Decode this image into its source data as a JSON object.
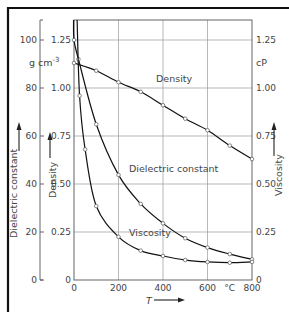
{
  "chart_data": {
    "type": "line",
    "title": "",
    "xlabel": "T",
    "x_unit": "°C",
    "xlim": [
      0,
      800
    ],
    "x_ticks": [
      0,
      200,
      400,
      600,
      800
    ],
    "x_tick_labels": [
      "0",
      "200",
      "400",
      "600",
      "°C",
      "800"
    ],
    "grid": true,
    "axes": {
      "left_outer": {
        "label": "Dielectric constant",
        "ticks": [
          0,
          20,
          40,
          60,
          80,
          100
        ],
        "tick_labels": [
          "0",
          "20",
          "40",
          "60",
          "80",
          "100"
        ],
        "ylim": [
          0,
          100
        ]
      },
      "left_inner": {
        "label": "Density",
        "unit": "g cm⁻³",
        "ticks": [
          0,
          0.25,
          0.5,
          0.75,
          1.0,
          1.25
        ],
        "tick_labels": [
          "0",
          "0.25",
          "0.50",
          "0.75",
          "1.00",
          "1.25"
        ],
        "ylim": [
          0,
          1.25
        ]
      },
      "right": {
        "label": "Viscosity",
        "unit": "cP",
        "ticks": [
          0,
          0.25,
          0.5,
          0.75,
          1.0,
          1.25
        ],
        "tick_labels": [
          "0",
          "0.25",
          "0.50",
          "0.75",
          "1.00",
          "1.25"
        ],
        "ylim": [
          0,
          1.25
        ]
      }
    },
    "series": [
      {
        "name": "Density",
        "axis": "left_inner",
        "x": [
          0,
          100,
          200,
          300,
          400,
          500,
          600,
          700,
          800
        ],
        "values": [
          1.13,
          1.09,
          1.03,
          0.98,
          0.91,
          0.84,
          0.78,
          0.7,
          0.63
        ]
      },
      {
        "name": "Dielectric constant",
        "axis": "left_outer",
        "x": [
          0,
          20,
          100,
          200,
          300,
          400,
          500,
          600,
          700,
          800
        ],
        "values": [
          100,
          92,
          64.9,
          43.8,
          31.7,
          23.6,
          17.4,
          13.5,
          10.8,
          8.6
        ]
      },
      {
        "name": "Viscosity",
        "axis": "right",
        "x": [
          25,
          50,
          100,
          200,
          300,
          400,
          500,
          600,
          700,
          800
        ],
        "values": [
          0.96,
          0.68,
          0.385,
          0.225,
          0.153,
          0.125,
          0.104,
          0.094,
          0.09,
          0.094
        ]
      }
    ],
    "annotations": [
      {
        "text": "Density",
        "near_x": 290,
        "series": "Density"
      },
      {
        "text": "Dielectric constant",
        "near_x": 310,
        "series": "Dielectric constant"
      },
      {
        "text": "Viscosity",
        "near_x": 320,
        "series": "Viscosity"
      }
    ],
    "legend": "none (inline curve labels)"
  },
  "labels": {
    "density_unit": "g cm",
    "density_unit_exp": "-3",
    "viscosity_unit": "cP",
    "x_var": "T",
    "x_unit": "°C",
    "left_outer_axis": "Dielectric constant",
    "left_inner_axis": "Density",
    "right_axis": "Viscosity",
    "curve_density": "Density",
    "curve_dielectric": "Dielectric constant",
    "curve_viscosity": "Viscosity"
  }
}
